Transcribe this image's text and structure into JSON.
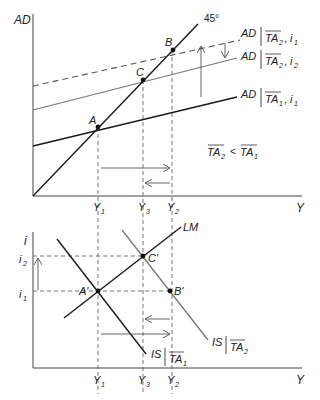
{
  "top_panel": {
    "y_axis_label": "AD",
    "x_axis_label": "Y",
    "line_45_label": "45°",
    "points": {
      "A": "A",
      "B": "B",
      "C": "C"
    },
    "curves": [
      {
        "id": "ad_ta2_i1",
        "label_main": "AD",
        "label_cond": "TA",
        "label_sub": "2",
        "label_rate": "i",
        "label_rate_sub": "1",
        "style": "dashed",
        "color": "#555555"
      },
      {
        "id": "ad_ta2_i2",
        "label_main": "AD",
        "label_cond": "TA",
        "label_sub": "2",
        "label_rate": "i",
        "label_rate_sub": "2",
        "style": "solid",
        "color": "#777777"
      },
      {
        "id": "ad_ta1_i1",
        "label_main": "AD",
        "label_cond": "TA",
        "label_sub": "1",
        "label_rate": "i",
        "label_rate_sub": "1",
        "style": "solid",
        "color": "#1a1a1a"
      }
    ],
    "inequality": {
      "left": "TA",
      "left_sub": "2",
      "op": "<",
      "right": "TA",
      "right_sub": "1"
    },
    "x_ticks": [
      {
        "main": "Y",
        "sub": "1"
      },
      {
        "main": "Y",
        "sub": "3"
      },
      {
        "main": "Y",
        "sub": "2"
      }
    ]
  },
  "bottom_panel": {
    "y_axis_label": "i",
    "x_axis_label": "Y",
    "y_ticks": [
      {
        "main": "i",
        "sub": "2"
      },
      {
        "main": "i",
        "sub": "1"
      }
    ],
    "points": {
      "A": "A'",
      "B": "B'",
      "C": "C'"
    },
    "curves": [
      {
        "id": "lm",
        "label_main": "LM",
        "color": "#1a1a1a"
      },
      {
        "id": "is_ta1",
        "label_main": "IS",
        "label_cond": "TA",
        "label_sub": "1",
        "color": "#1a1a1a"
      },
      {
        "id": "is_ta2",
        "label_main": "IS",
        "label_cond": "TA",
        "label_sub": "2",
        "color": "#777777"
      }
    ],
    "x_ticks": [
      {
        "main": "Y",
        "sub": "1"
      },
      {
        "main": "Y",
        "sub": "3"
      },
      {
        "main": "Y",
        "sub": "2"
      }
    ]
  }
}
